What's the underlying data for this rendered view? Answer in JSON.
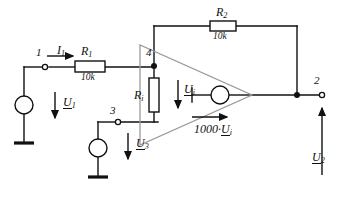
{
  "diagram": {
    "type": "electrical-schematic",
    "nodes": [
      {
        "id": "n1",
        "label": "1",
        "x": 45,
        "y": 67
      },
      {
        "id": "n4",
        "label": "4",
        "x": 154,
        "y": 66
      },
      {
        "id": "n3",
        "label": "3",
        "x": 118,
        "y": 122
      },
      {
        "id": "n2",
        "label": "2",
        "x": 322,
        "y": 95
      }
    ],
    "components": {
      "r1": {
        "name": "R",
        "sub": "1",
        "value": "10k"
      },
      "r2": {
        "name": "R",
        "sub": "2",
        "value": "10k"
      },
      "ri": {
        "name": "R",
        "sub": "i"
      },
      "source_u1": {
        "name": "U",
        "sub": "1"
      },
      "source_u3": {
        "name": "U",
        "sub": "3"
      },
      "dependent_source": {
        "gain": "1000",
        "operator": "·",
        "name": "U",
        "sub": "i"
      }
    },
    "labels": {
      "current_i1": {
        "name": "I",
        "sub": "1"
      },
      "voltage_ui": {
        "name": "U",
        "sub": "i"
      },
      "voltage_u1": {
        "name": "U",
        "sub": "1"
      },
      "voltage_u2": {
        "name": "U",
        "sub": "2"
      },
      "voltage_u3": {
        "name": "U",
        "sub": "3"
      }
    },
    "colors": {
      "wire": "#111111",
      "triangle": "#999999",
      "background": "#ffffff"
    }
  }
}
